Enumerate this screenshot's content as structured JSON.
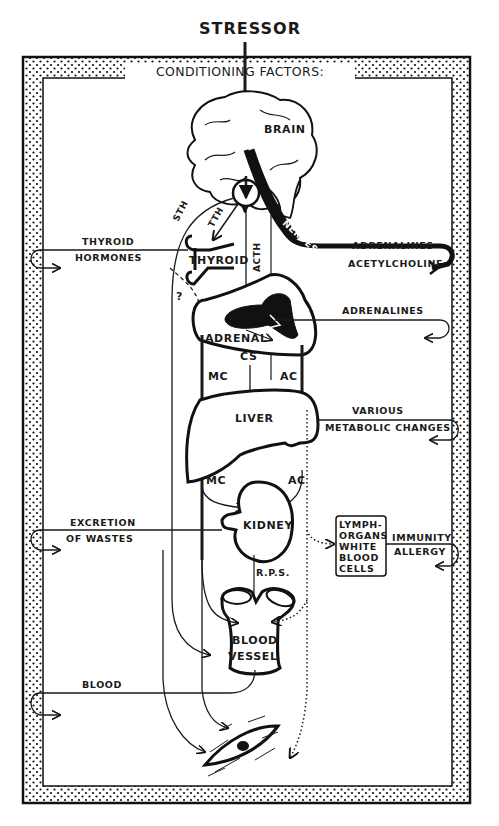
{
  "diagram": {
    "title": "STRESSOR",
    "frame_label": "CONDITIONING FACTORS:",
    "organs": {
      "brain": "BRAIN",
      "thyroid": "THYROID",
      "adrenal": "ADRENAL",
      "liver": "LIVER",
      "kidney": "KIDNEY",
      "lymph": [
        "LYMPH-",
        "ORGANS",
        "WHITE",
        "BLOOD",
        "CELLS"
      ],
      "blood_vessel": [
        "BLOOD",
        "VESSEL"
      ]
    },
    "pathway_labels": {
      "sth": "STH",
      "tth": "TTH",
      "acth": "ACTH",
      "nerves": "NERVES",
      "question": "?",
      "cs": "CS",
      "mc_upper": "MC",
      "ac_upper": "AC",
      "mc_lower": "MC",
      "ac_lower": "AC",
      "rps": "R.P.S."
    },
    "effects": {
      "thyroid_hormones": [
        "THYROID",
        "HORMONES"
      ],
      "nerves_output": [
        "ADRENALINES",
        "ACETYLCHOLINE"
      ],
      "adrenal_output": "ADRENALINES",
      "liver_output": [
        "VARIOUS",
        "METABOLIC CHANGES"
      ],
      "kidney_output": [
        "EXCRETION",
        "OF WASTES"
      ],
      "lymph_output": [
        "IMMUNITY",
        "ALLERGY"
      ],
      "blood_output": "BLOOD"
    },
    "target": "tissue-cell"
  }
}
